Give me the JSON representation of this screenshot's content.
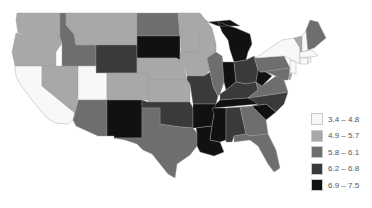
{
  "chart_data": {
    "type": "choropleth",
    "title": "",
    "region": "Contiguous United States",
    "legend": {
      "position": "bottom-right",
      "bins": [
        {
          "label": "3.4 – 4.8",
          "min": 3.4,
          "max": 4.8,
          "color": "#f8f8f8"
        },
        {
          "label": "4.9 – 5.7",
          "min": 4.9,
          "max": 5.7,
          "color": "#a8a8a8"
        },
        {
          "label": "5.8 – 6.1",
          "min": 5.8,
          "max": 6.1,
          "color": "#6e6e6e"
        },
        {
          "label": "6.2 – 6.8",
          "min": 6.2,
          "max": 6.8,
          "color": "#3a3a3a"
        },
        {
          "label": "6.9 – 7.5",
          "min": 6.9,
          "max": 7.5,
          "color": "#111111"
        }
      ]
    },
    "states": {
      "WA": 1,
      "OR": 1,
      "CA": 0,
      "NV": 1,
      "ID": 2,
      "MT": 1,
      "WY": 3,
      "UT": 0,
      "CO": 1,
      "AZ": 2,
      "NM": 4,
      "ND": 2,
      "SD": 4,
      "NE": 1,
      "KS": 1,
      "OK": 3,
      "TX": 2,
      "MN": 1,
      "IA": 1,
      "MO": 3,
      "AR": 4,
      "LA": 4,
      "WI": 1,
      "IL": 2,
      "MI": 4,
      "IN": 4,
      "OH": 3,
      "KY": 3,
      "TN": 4,
      "MS": 4,
      "AL": 3,
      "GA": 2,
      "FL": 2,
      "SC": 4,
      "NC": 3,
      "VA": 2,
      "WV": 4,
      "PA": 2,
      "NY": 0,
      "VT": 1,
      "NH": 0,
      "ME": 2,
      "MA": 0,
      "CT": 0,
      "RI": 0,
      "NJ": 0,
      "DE": 1,
      "MD": 2
    }
  }
}
